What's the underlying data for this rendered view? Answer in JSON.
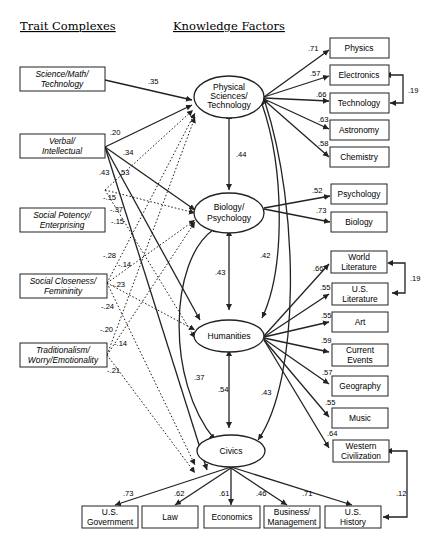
{
  "headers": {
    "trait_complexes": "Trait Complexes",
    "knowledge_factors": "Knowledge Factors"
  },
  "traits": [
    {
      "line1": "Science/Math/",
      "line2": "Technology"
    },
    {
      "line1": "Verbal/",
      "line2": "Intellectual"
    },
    {
      "line1": "Social Potency/",
      "line2": "Enterprising"
    },
    {
      "line1": "Social Closeness/",
      "line2": "Femininity"
    },
    {
      "line1": "Traditionalism/",
      "line2": "Worry/Emotionality"
    }
  ],
  "factors": {
    "physical": {
      "line1": "Physical",
      "line2": "Sciences/",
      "line3": "Technology"
    },
    "biology": {
      "line1": "Biology/",
      "line2": "Psychology"
    },
    "humanities": {
      "line1": "Humanities"
    },
    "civics": {
      "line1": "Civics"
    }
  },
  "indicators": {
    "physical": [
      {
        "label": "Physics",
        "loading": ".71"
      },
      {
        "label": "Electronics",
        "loading": ".57"
      },
      {
        "label": "Technology",
        "loading": ".66"
      },
      {
        "label": "Astronomy",
        "loading": ".63"
      },
      {
        "label": "Chemistry",
        "loading": ".58"
      }
    ],
    "biology": [
      {
        "label": "Psychology",
        "loading": ".52"
      },
      {
        "label": "Biology",
        "loading": ".73"
      }
    ],
    "humanities": [
      {
        "line1": "World",
        "line2": "Literature",
        "loading": ".66"
      },
      {
        "line1": "U.S.",
        "line2": "Literature",
        "loading": ".55"
      },
      {
        "line1": "Art",
        "line2": "",
        "loading": ".55"
      },
      {
        "line1": "Current",
        "line2": "Events",
        "loading": ".59"
      },
      {
        "line1": "Geography",
        "line2": "",
        "loading": ".57"
      },
      {
        "line1": "Music",
        "line2": "",
        "loading": ".55"
      },
      {
        "line1": "Western",
        "line2": "Civilization",
        "loading": ".64"
      }
    ],
    "civics": [
      {
        "line1": "U.S.",
        "line2": "Government",
        "loading": ".73"
      },
      {
        "line1": "Law",
        "line2": "",
        "loading": ".62"
      },
      {
        "line1": "Economics",
        "line2": "",
        "loading": ".61"
      },
      {
        "line1": "Business/",
        "line2": "Management",
        "loading": ".46"
      },
      {
        "line1": "U.S.",
        "line2": "History",
        "loading": ".71"
      }
    ]
  },
  "residual_correlations": {
    "electronics_technology": ".19",
    "world_us_literature": ".19",
    "western_civ_us_history": ".12"
  },
  "factor_correlations": {
    "physical_biology": ".44",
    "biology_humanities": ".43",
    "physical_humanities": ".42",
    "humanities_civics": ".54",
    "physical_civics": ".43",
    "biology_civics": ".37"
  },
  "trait_paths": {
    "sci_physical": ".35",
    "verbal_physical": ".20",
    "verbal_biology": ".34",
    "verbal_humanities": ".53",
    "verbal_civics": ".43",
    "social_potency_a": "-.15",
    "social_potency_b": "-.37",
    "social_potency_c": "-.15",
    "social_closeness_a": "-.28",
    "social_closeness_b": "-.14",
    "social_closeness_c": "-.23",
    "social_closeness_d": "-.24",
    "traditional_a": "-.20",
    "traditional_b": "-.14",
    "traditional_c": "-.21"
  }
}
